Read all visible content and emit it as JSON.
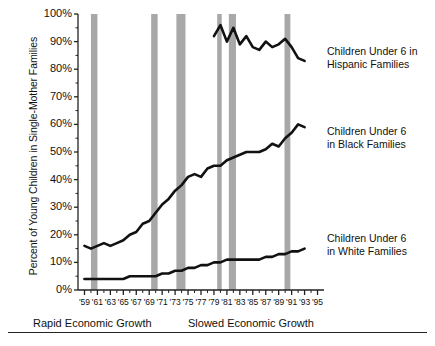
{
  "axes": {
    "ylabel": "Percent of Young Children in Single-Mother Families",
    "yticks": [
      "100%",
      "90%",
      "80%",
      "70%",
      "60%",
      "50%",
      "40%",
      "30%",
      "20%",
      "10%",
      "0%"
    ],
    "xticks": [
      "'59",
      "'61",
      "'63",
      "'65",
      "'67",
      "'69",
      "'71",
      "'73",
      "'75",
      "'77",
      "'79",
      "'81",
      "'83",
      "'85",
      "'87",
      "'89",
      "'91",
      "'93",
      "'95"
    ]
  },
  "annotations": {
    "hispanic_line1": "Children Under 6 in",
    "hispanic_line2": "Hispanic Families",
    "black_line1": "Children Under 6",
    "black_line2": "in Black Families",
    "white_line1": "Children Under 6",
    "white_line2": "in White Families",
    "rapid_growth": "Rapid Economic Growth",
    "slowed_growth": "Slowed Economic Growth"
  },
  "colors": {
    "line": "#111111",
    "recession_band": "#a8a8a8",
    "axis": "#222222",
    "background": "#ffffff"
  },
  "chart_data": {
    "type": "line",
    "title": "",
    "xlabel": "",
    "ylabel": "Percent of Young Children in Single-Mother Families",
    "xlim": [
      1958,
      1996
    ],
    "ylim": [
      0,
      100
    ],
    "grid": false,
    "legend_position": "inline-right",
    "recession_bands": [
      {
        "start": 1960.0,
        "end": 1961.0
      },
      {
        "start": 1969.3,
        "end": 1970.3
      },
      {
        "start": 1973.2,
        "end": 1974.6
      },
      {
        "start": 1979.5,
        "end": 1980.2
      },
      {
        "start": 1981.3,
        "end": 1982.4
      },
      {
        "start": 1989.9,
        "end": 1990.8
      }
    ],
    "series": [
      {
        "name": "Children Under 6 in Hispanic Families",
        "x": [
          1979,
          1980,
          1981,
          1982,
          1983,
          1984,
          1985,
          1986,
          1987,
          1988,
          1989,
          1990,
          1991,
          1992,
          1993
        ],
        "values": [
          92,
          96,
          90,
          95,
          89,
          92,
          88,
          87,
          90,
          88,
          89,
          91,
          88,
          84,
          83
        ]
      },
      {
        "name": "Children Under 6 in Black Families",
        "x": [
          1959,
          1960,
          1961,
          1962,
          1963,
          1964,
          1965,
          1966,
          1967,
          1968,
          1969,
          1970,
          1971,
          1972,
          1973,
          1974,
          1975,
          1976,
          1977,
          1978,
          1979,
          1980,
          1981,
          1982,
          1983,
          1984,
          1985,
          1986,
          1987,
          1988,
          1989,
          1990,
          1991,
          1992,
          1993
        ],
        "values": [
          16,
          15,
          16,
          17,
          16,
          17,
          18,
          20,
          21,
          24,
          25,
          28,
          31,
          33,
          36,
          38,
          41,
          42,
          41,
          44,
          45,
          45,
          47,
          48,
          49,
          50,
          50,
          50,
          51,
          53,
          52,
          55,
          57,
          60,
          59
        ]
      },
      {
        "name": "Children Under 6 in White Families",
        "x": [
          1959,
          1960,
          1961,
          1962,
          1963,
          1964,
          1965,
          1966,
          1967,
          1968,
          1969,
          1970,
          1971,
          1972,
          1973,
          1974,
          1975,
          1976,
          1977,
          1978,
          1979,
          1980,
          1981,
          1982,
          1983,
          1984,
          1985,
          1986,
          1987,
          1988,
          1989,
          1990,
          1991,
          1992,
          1993
        ],
        "values": [
          4,
          4,
          4,
          4,
          4,
          4,
          4,
          5,
          5,
          5,
          5,
          5,
          6,
          6,
          7,
          7,
          8,
          8,
          9,
          9,
          10,
          10,
          11,
          11,
          11,
          11,
          11,
          11,
          12,
          12,
          13,
          13,
          14,
          14,
          15
        ]
      }
    ]
  }
}
